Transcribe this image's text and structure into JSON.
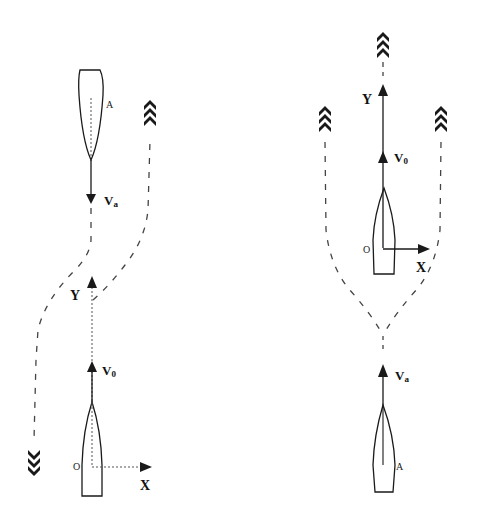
{
  "diagram": {
    "left": {
      "ship_a": {
        "label": "A",
        "velocity_label": "V",
        "velocity_sub": "a"
      },
      "own_ship": {
        "origin_label": "O",
        "velocity_label": "V",
        "velocity_sub": "0",
        "x_axis": "X",
        "y_axis": "Y"
      }
    },
    "right": {
      "own_ship": {
        "origin_label": "O",
        "velocity_label": "V",
        "velocity_sub": "0",
        "x_axis": "X",
        "y_axis": "Y"
      },
      "ship_a": {
        "label": "A",
        "velocity_label": "V",
        "velocity_sub": "a"
      }
    },
    "colors": {
      "stroke": "#1a1a1a",
      "dashed": "#444444"
    }
  }
}
